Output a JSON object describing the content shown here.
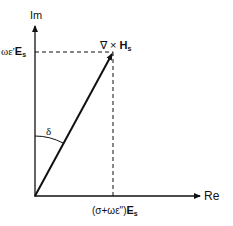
{
  "diagram": {
    "type": "phasor-diagram",
    "axes": {
      "vertical_label": "Im",
      "horizontal_label": "Re"
    },
    "vector": {
      "label_prefix": "∇ × ",
      "label_main": "H",
      "label_sub": "s"
    },
    "angle_label": "δ",
    "im_component": {
      "prefix": "ωε'",
      "main": "E",
      "sub": "s"
    },
    "re_component": {
      "prefix": "(σ+ωε\")",
      "main": "E",
      "sub": "s"
    },
    "colors": {
      "line": "#111111",
      "background": "#ffffff"
    }
  }
}
